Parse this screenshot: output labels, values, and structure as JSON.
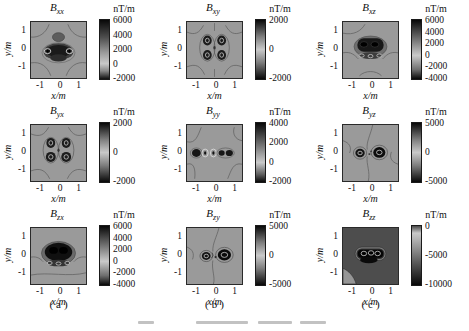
{
  "figure": {
    "caption_note": "",
    "column_labels": [
      "(a)",
      "(b)",
      "(c)"
    ]
  },
  "chart_data": {
    "type": "heatmap",
    "layout": "3x3 grid of magnetic gradient tensor contour maps, grayscale diverging colormap (dark at both extremes, light near zero)",
    "symbol": "B",
    "colorbar_label": "nT/m",
    "xlabel": "x/m",
    "ylabel": "y/m",
    "xticks": [
      "-1",
      "0",
      "1"
    ],
    "yticks": [
      "1",
      "0",
      "-1"
    ],
    "xlim": [
      -1.5,
      1.5
    ],
    "ylim": [
      -1.5,
      1.5
    ],
    "column_labels": [
      "(a)",
      "(b)",
      "(c)"
    ],
    "panels": [
      {
        "name": "Bxx",
        "sub": "xx",
        "column": "(a)",
        "colorbar_ticks": [
          "6000",
          "4000",
          "2000",
          "0",
          "-2000"
        ],
        "value_range": [
          -2000,
          6000
        ],
        "pattern": "dark horizontal anomaly cluster at center with ring contours, darker patch above center"
      },
      {
        "name": "Bxy",
        "sub": "xy",
        "column": "(b)",
        "colorbar_ticks": [
          "2000",
          "0",
          "-2000"
        ],
        "value_range": [
          -2000,
          2000
        ],
        "pattern": "four-lobe quadrupole pattern, two dark lobe pairs left and right of center"
      },
      {
        "name": "Bxz",
        "sub": "xz",
        "column": "(c)",
        "colorbar_ticks": [
          "6000",
          "4000",
          "2000",
          "0",
          "-2000",
          "-4000"
        ],
        "value_range": [
          -4000,
          6000
        ],
        "pattern": "large dark rounded anomaly above center with fringe of small rings below"
      },
      {
        "name": "Byx",
        "sub": "yx",
        "column": "(a)",
        "colorbar_ticks": [
          "2000",
          "0",
          "-2000"
        ],
        "value_range": [
          -2000,
          2000
        ],
        "pattern": "four-lobe quadrupole pattern similar to Bxy"
      },
      {
        "name": "Byy",
        "sub": "yy",
        "column": "(b)",
        "colorbar_ticks": [
          "4000",
          "2000",
          "0",
          "-2000"
        ],
        "value_range": [
          -2000,
          4000
        ],
        "pattern": "horizontal row of small dark blobs and ring contours along y=0"
      },
      {
        "name": "Byz",
        "sub": "yz",
        "column": "(c)",
        "colorbar_ticks": [
          "5000",
          "0",
          "-5000"
        ],
        "value_range": [
          -5000,
          5000
        ],
        "pattern": "two dark blobs left and right of center on y=0"
      },
      {
        "name": "Bzx",
        "sub": "zx",
        "column": "(a)",
        "colorbar_ticks": [
          "6000",
          "4000",
          "2000",
          "0",
          "-2000",
          "-4000"
        ],
        "value_range": [
          -4000,
          6000
        ],
        "pattern": "large very dark anomaly slightly above center with light ring fringe below"
      },
      {
        "name": "Bzy",
        "sub": "zy",
        "column": "(b)",
        "colorbar_ticks": [
          "5000",
          "0",
          "-5000"
        ],
        "value_range": [
          -5000,
          5000
        ],
        "pattern": "small dark blob left and larger dark blob right of center on y=0"
      },
      {
        "name": "Bzz",
        "sub": "zz",
        "column": "(c)",
        "colorbar_ticks": [
          "0",
          "-5000",
          "-10000"
        ],
        "value_range": [
          -10000,
          0
        ],
        "pattern": "dark background, central dark capsule anomaly outlined by light contour rings, lighter wedge at bottom-left corner"
      }
    ]
  }
}
